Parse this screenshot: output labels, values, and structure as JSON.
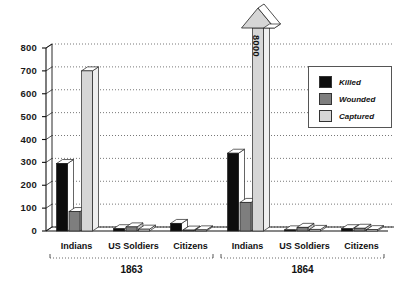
{
  "chart_data": {
    "type": "bar",
    "title": "",
    "subtitle": "",
    "xlabel": "",
    "ylabel": "",
    "ylim": [
      0,
      800
    ],
    "yticks": [
      0,
      100,
      200,
      300,
      400,
      500,
      600,
      700,
      800
    ],
    "ytick_labels": [
      "0",
      "100",
      "200",
      "300",
      "400",
      "500",
      "600",
      "700",
      "800"
    ],
    "grid": true,
    "grid_style": "dotted-horizontal",
    "legend_position": "top-right",
    "style_note": "3D extruded bars, broken scale arrow for off-chart value",
    "group_labels": [
      "1863",
      "1864"
    ],
    "categories": [
      "Indians",
      "US Soldiers",
      "Citizens",
      "Indians",
      "US Soldiers",
      "Citizens"
    ],
    "series": [
      {
        "name": "Killed",
        "color": "#0d0d0d",
        "values": [
          295,
          10,
          33,
          340,
          5,
          10
        ]
      },
      {
        "name": "Wounded",
        "color": "#7e7e7e",
        "values": [
          85,
          18,
          4,
          125,
          16,
          12
        ]
      },
      {
        "name": "Captured",
        "color": "#d6d6d6",
        "values": [
          700,
          8,
          5,
          8000,
          7,
          6
        ]
      }
    ],
    "annotations": [
      {
        "text": "8000",
        "target": "1864 Indians Captured",
        "note": "value exceeds axis; drawn as upward break arrow",
        "rotated": true
      }
    ]
  },
  "axis": {
    "y_tick_labels": [
      "800",
      "700",
      "600",
      "500",
      "400",
      "300",
      "200",
      "100",
      "0"
    ]
  },
  "legend": {
    "items": [
      {
        "label": "Killed",
        "color": "#0d0d0d"
      },
      {
        "label": "Wounded",
        "color": "#7e7e7e"
      },
      {
        "label": "Captured",
        "color": "#d6d6d6"
      }
    ]
  },
  "categories_row": [
    {
      "label": "Indians"
    },
    {
      "label": "US Soldiers"
    },
    {
      "label": "Citizens"
    },
    {
      "label": "Indians"
    },
    {
      "label": "US Soldiers"
    },
    {
      "label": "Citizens"
    }
  ],
  "years": [
    {
      "label": "1863"
    },
    {
      "label": "1864"
    }
  ],
  "arrow": {
    "label": "8000"
  },
  "colors": {
    "killed": "#0d0d0d",
    "wounded": "#7e7e7e",
    "captured": "#d6d6d6",
    "background": "#ffffff",
    "axis": "#1a1a1a",
    "grid": "#666666"
  }
}
